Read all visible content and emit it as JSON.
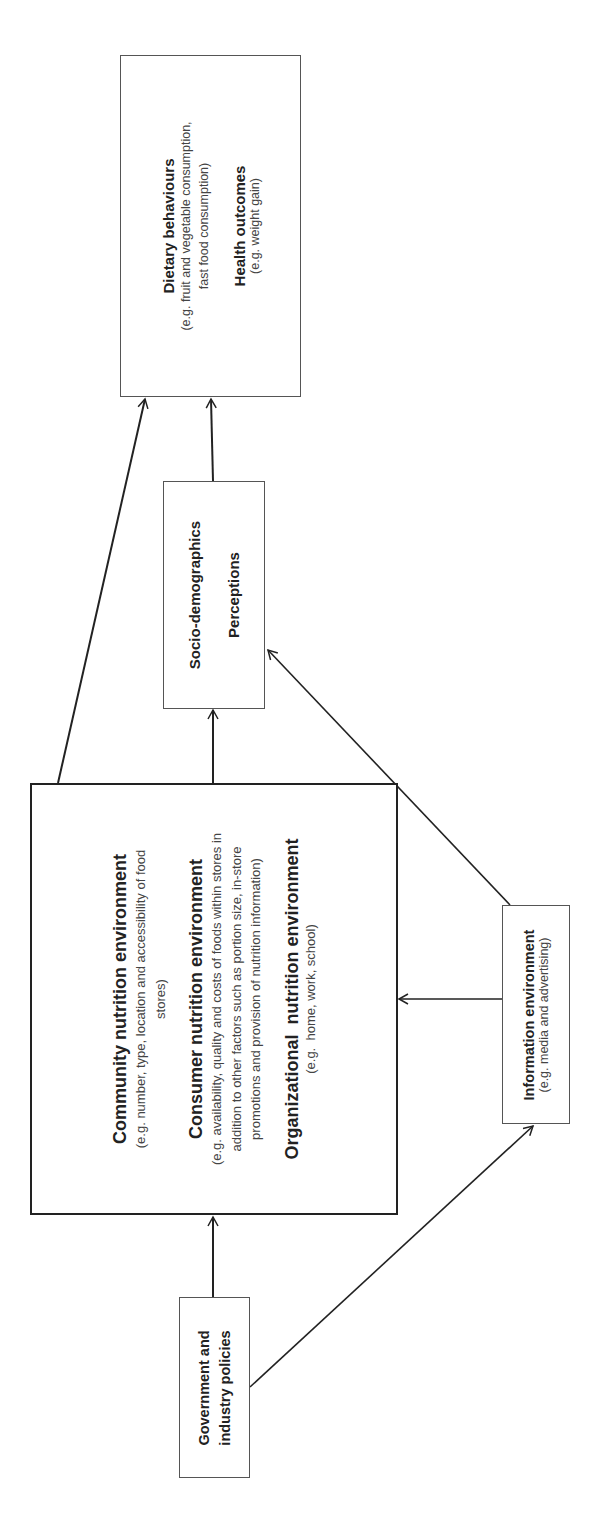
{
  "diagram": {
    "orientation": "rotated -90deg (reads bottom-to-top)",
    "nodes": {
      "government": {
        "title": "Government and industry policies"
      },
      "main": {
        "community": {
          "title": "Community nutrition environment",
          "detail": "(e.g. number, type, location and accessibility of food stores)"
        },
        "consumer": {
          "title": "Consumer nutrition environment",
          "detail": "(e.g.  availability, quality and costs of foods within stores in addition to other factors such as portion size, in-store promotions and provision of nutrition information)"
        },
        "organizational": {
          "title": "Organizational  nutrition environment",
          "detail": "(e.g.  home, work, school)"
        }
      },
      "information": {
        "title": "Information environment",
        "detail": "(e.g. media and advertising)"
      },
      "mediators": {
        "line1": "Socio-demographics",
        "line2": "Perceptions"
      },
      "outcomes": {
        "dietary": {
          "title": "Dietary behaviours",
          "detail": "(e.g. fruit and vegetable consumption, fast food consumption)"
        },
        "health": {
          "title": "Health outcomes",
          "detail": "(e.g. weight gain)"
        }
      }
    },
    "edges": [
      {
        "from": "government",
        "to": "main"
      },
      {
        "from": "government",
        "to": "information"
      },
      {
        "from": "information",
        "to": "main"
      },
      {
        "from": "information",
        "to": "mediators"
      },
      {
        "from": "main",
        "to": "mediators"
      },
      {
        "from": "main",
        "to": "outcomes"
      },
      {
        "from": "mediators",
        "to": "outcomes"
      }
    ]
  }
}
